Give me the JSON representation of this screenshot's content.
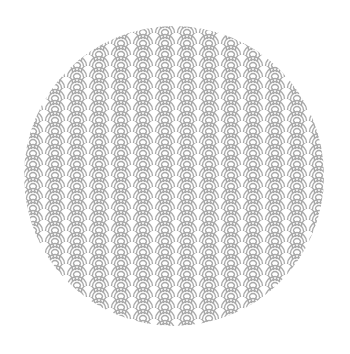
{
  "image": {
    "subject": "seigaiha-wave-pattern-circle",
    "background_color": "#ffffff",
    "pattern_color": "#a9a9a9",
    "circle": {
      "cx": 174,
      "cy": 176,
      "r": 150
    },
    "tile": {
      "width": 22,
      "height": 11,
      "arcs": 3
    }
  }
}
